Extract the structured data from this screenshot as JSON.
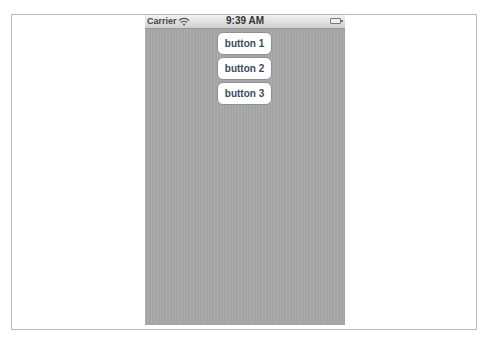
{
  "status_bar": {
    "carrier": "Carrier",
    "wifi_icon": "wifi-icon",
    "time": "9:39 AM",
    "battery_icon": "battery-icon"
  },
  "buttons": [
    {
      "label": "button 1"
    },
    {
      "label": "button 2"
    },
    {
      "label": "button 3"
    }
  ],
  "colors": {
    "background": "#a9a9a9",
    "button_bg": "#ffffff",
    "button_text": "#3b4a5f"
  }
}
